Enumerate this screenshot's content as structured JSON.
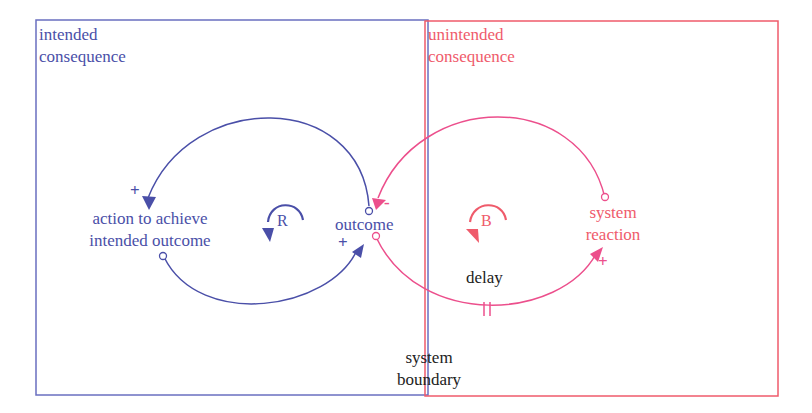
{
  "regions": {
    "intended": {
      "label_line1": "intended",
      "label_line2": "consequence",
      "color": "#5a5fb5"
    },
    "unintended": {
      "label_line1": "unintended",
      "label_line2": "consequence",
      "color": "#ef5b6b"
    }
  },
  "variables": {
    "action": {
      "line1": "action to achieve",
      "line2": "intended outcome"
    },
    "outcome": {
      "label": "outcome"
    },
    "reaction": {
      "line1": "system",
      "line2": "reaction"
    }
  },
  "loops": {
    "reinforcing": {
      "label": "R"
    },
    "balancing": {
      "label": "B"
    }
  },
  "annotations": {
    "delay": "delay",
    "boundary_line1": "system",
    "boundary_line2": "boundary"
  },
  "polarities": {
    "outcome_to_action": "+",
    "action_to_outcome": "+",
    "reaction_to_outcome": "-",
    "outcome_to_reaction": "+"
  },
  "colors": {
    "blue": "#4a4fa8",
    "pink": "#ec4f8c",
    "red": "#ef5b6b"
  }
}
